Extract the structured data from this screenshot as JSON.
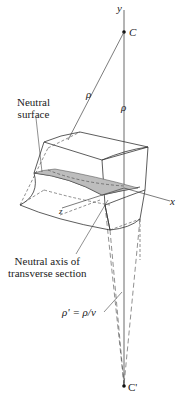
{
  "diagram": {
    "axes": {
      "y_label": "y",
      "x_label": "x",
      "z_label": "z"
    },
    "points": {
      "center": "C",
      "anticlastic_center": "C'"
    },
    "radii": {
      "rho_left": "ρ",
      "rho_axis": "ρ",
      "rho_prime": "ρ' = ρ/ν"
    },
    "annotations": {
      "neutral_surface_line1": "Neutral",
      "neutral_surface_line2": "surface",
      "neutral_axis_line1": "Neutral axis of",
      "neutral_axis_line2": "transverse section"
    },
    "colors": {
      "line": "#333333",
      "shade": "#bdbdbd"
    }
  }
}
